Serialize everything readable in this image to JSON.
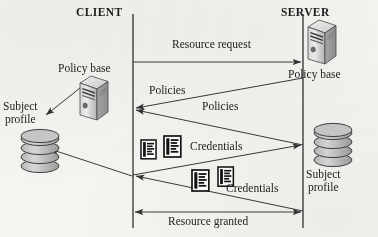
{
  "diagram": {
    "type": "sequence-diagram",
    "title_left": "CLIENT",
    "title_right": "SERVER",
    "background_color": "#f6f4f1",
    "line_color": "#3a3a3a",
    "lifelines": [
      {
        "name": "client-lifeline",
        "label": "CLIENT",
        "x": 133
      },
      {
        "name": "server-lifeline",
        "label": "SERVER",
        "x": 303
      }
    ],
    "headers": [
      {
        "id": "client",
        "label": "CLIENT",
        "x": 76,
        "y": 6
      },
      {
        "id": "server",
        "label": "SERVER",
        "x": 281,
        "y": 6
      }
    ],
    "nodes": [
      {
        "id": "client-policy-base",
        "icon": "server-tower-icon",
        "label": "Policy base",
        "label_x": 58,
        "label_y": 62,
        "icon_x": 78,
        "icon_y": 78
      },
      {
        "id": "client-subject-profile",
        "icon": "database-icon",
        "label": "Subject\nprofile",
        "label_line1": "Subject",
        "label_line2": "profile",
        "label_x": 3,
        "label_y": 100,
        "icon_x": 14,
        "icon_y": 134
      },
      {
        "id": "server-policy-base",
        "icon": "server-tower-icon",
        "label": "Policy base",
        "label_x": 288,
        "label_y": 68,
        "icon_x": 306,
        "icon_y": 22
      },
      {
        "id": "server-subject-profile",
        "icon": "database-icon",
        "label": "Subject\nprofile",
        "label_line1": "Subject",
        "label_line2": "profile",
        "label_x": 306,
        "label_y": 168,
        "icon_x": 312,
        "icon_y": 128
      }
    ],
    "messages": [
      {
        "id": "resource-request",
        "label": "Resource request",
        "direction": "client-to-server",
        "arrow": "single",
        "label_x": 172,
        "label_y": 38,
        "from_x": 133,
        "from_y": 62,
        "to_x": 303,
        "to_y": 62
      },
      {
        "id": "policies-upper",
        "label": "Policies",
        "direction": "server-to-client",
        "arrow": "single",
        "label_x": 149,
        "label_y": 84,
        "from_x": 303,
        "from_y": 78,
        "to_x": 133,
        "to_y": 108
      },
      {
        "id": "policies-lower",
        "label": "Policies",
        "direction": "server-to-client",
        "arrow": "single",
        "label_x": 202,
        "label_y": 100,
        "from_x": 303,
        "from_y": 145,
        "to_x": 133,
        "to_y": 110
      },
      {
        "id": "credentials-upper",
        "label": "Credentials",
        "direction": "client-to-server",
        "arrow": "single",
        "label_x": 190,
        "label_y": 140,
        "from_x": 133,
        "from_y": 175,
        "to_x": 303,
        "to_y": 145
      },
      {
        "id": "credentials-lower",
        "label": "Credentials",
        "direction": "server-to-client",
        "arrow": "single",
        "label_x": 226,
        "label_y": 182,
        "from_x": 303,
        "from_y": 211,
        "to_x": 133,
        "to_y": 176
      },
      {
        "id": "resource-granted",
        "label": "Resource granted",
        "direction": "bidirectional",
        "arrow": "double",
        "label_x": 168,
        "label_y": 215,
        "from_x": 133,
        "from_y": 212,
        "to_x": 303,
        "to_y": 212
      }
    ],
    "internal_arrows": [
      {
        "id": "policy-base-to-subject-profile",
        "from_x": 80,
        "from_y": 88,
        "to_x": 44,
        "to_y": 116,
        "arrow": "single"
      },
      {
        "id": "lifeline-to-subject-profile",
        "from_x": 132,
        "from_y": 176,
        "to_x": 48,
        "to_y": 148,
        "arrow": "single"
      }
    ],
    "credential_icons": [
      {
        "id": "credential-icon-1",
        "x": 141,
        "y": 140,
        "w": 15,
        "h": 19
      },
      {
        "id": "credential-icon-2",
        "x": 163,
        "y": 136,
        "w": 17,
        "h": 21
      },
      {
        "id": "credential-icon-3",
        "x": 192,
        "y": 170,
        "w": 17,
        "h": 21
      },
      {
        "id": "credential-icon-4",
        "x": 217,
        "y": 168,
        "w": 16,
        "h": 20
      }
    ],
    "icon_names": {
      "server": "server-tower-icon",
      "database": "database-icon",
      "credential": "credential-document-icon",
      "arrowhead": "arrowhead-icon"
    }
  }
}
